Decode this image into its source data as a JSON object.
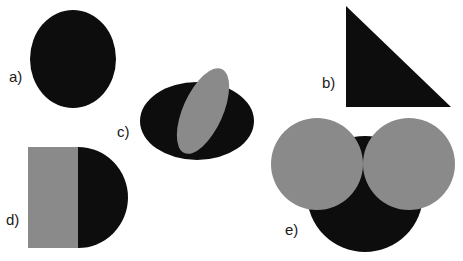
{
  "colors": {
    "black": "#0d0d0d",
    "gray": "#8a8a8a",
    "background": "#ffffff"
  },
  "labels": {
    "a": "a)",
    "b": "b)",
    "c": "c)",
    "d": "d)",
    "e": "e)"
  },
  "shapes": [
    {
      "id": "a",
      "description": "black ellipse"
    },
    {
      "id": "b",
      "description": "black right triangle"
    },
    {
      "id": "c",
      "description": "black horizontal ellipse with overlapping tilted gray ellipse"
    },
    {
      "id": "d",
      "description": "gray rectangle with black half-disc on right"
    },
    {
      "id": "e",
      "description": "two gray circles overlapping a black circle below"
    }
  ]
}
